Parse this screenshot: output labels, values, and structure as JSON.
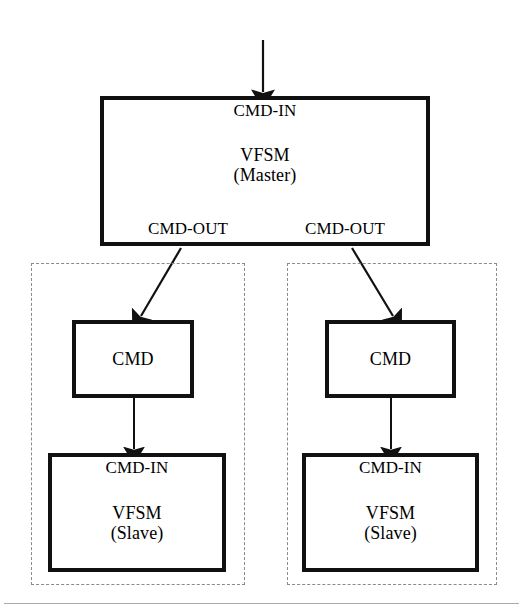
{
  "figure": {
    "kind": "block-diagram",
    "width": 523,
    "height": 614,
    "colors": {
      "background": "#ffffff",
      "stroke": "#111111",
      "group_dash": "#8a8a8a",
      "rule": "#9a9a9a"
    }
  },
  "master": {
    "input_port_label": "CMD-IN",
    "title_line1": "VFSM",
    "title_line2": "(Master)",
    "output_port_left_label": "CMD-OUT",
    "output_port_right_label": "CMD-OUT"
  },
  "groups": [
    {
      "name": "left-slave-group",
      "cmd_box_label": "CMD",
      "slave": {
        "input_port_label": "CMD-IN",
        "title_line1": "VFSM",
        "title_line2": "(Slave)"
      }
    },
    {
      "name": "right-slave-group",
      "cmd_box_label": "CMD",
      "slave": {
        "input_port_label": "CMD-IN",
        "title_line1": "VFSM",
        "title_line2": "(Slave)"
      }
    }
  ],
  "connectors": [
    {
      "name": "external-input-to-master",
      "style": "solid-arrow",
      "direction": "down"
    },
    {
      "name": "master-to-left-cmd",
      "style": "solid-arrow",
      "direction": "down-left"
    },
    {
      "name": "master-to-right-cmd",
      "style": "solid-arrow",
      "direction": "down-right"
    },
    {
      "name": "left-cmd-to-left-slave",
      "style": "solid-arrow",
      "direction": "down"
    },
    {
      "name": "right-cmd-to-right-slave",
      "style": "solid-arrow",
      "direction": "down"
    }
  ]
}
